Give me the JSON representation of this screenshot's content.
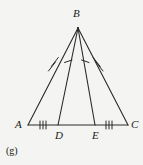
{
  "figure": {
    "caption": "(g)",
    "background_color": "#f4f4f2",
    "stroke_color": "#2a2a2a",
    "label_color": "#1a1a1a",
    "width": 143,
    "height": 165,
    "type": "geometry-diagram",
    "shape": "isosceles-triangle-with-two-cevians",
    "vertices": [
      {
        "name": "B",
        "label": "B",
        "x": 78,
        "y": 28
      },
      {
        "name": "A",
        "label": "A",
        "x": 28,
        "y": 125
      },
      {
        "name": "D",
        "label": "D",
        "x": 58,
        "y": 125
      },
      {
        "name": "E",
        "label": "E",
        "x": 95,
        "y": 125
      },
      {
        "name": "C",
        "label": "C",
        "x": 128,
        "y": 125
      }
    ],
    "segments": [
      {
        "name": "AB",
        "from": "A",
        "to": "B",
        "tick_count": 2,
        "tick_style": "slash"
      },
      {
        "name": "BC",
        "from": "B",
        "to": "C",
        "tick_count": 2,
        "tick_style": "slash"
      },
      {
        "name": "BD",
        "from": "B",
        "to": "D",
        "tick_count": 1,
        "tick_style": "slash"
      },
      {
        "name": "BE",
        "from": "B",
        "to": "E",
        "tick_count": 1,
        "tick_style": "slash"
      },
      {
        "name": "AD",
        "from": "A",
        "to": "D",
        "tick_count": 3,
        "tick_style": "vertical"
      },
      {
        "name": "DE",
        "from": "D",
        "to": "E",
        "tick_count": 0,
        "tick_style": "none"
      },
      {
        "name": "EC",
        "from": "E",
        "to": "C",
        "tick_count": 3,
        "tick_style": "vertical"
      }
    ]
  }
}
